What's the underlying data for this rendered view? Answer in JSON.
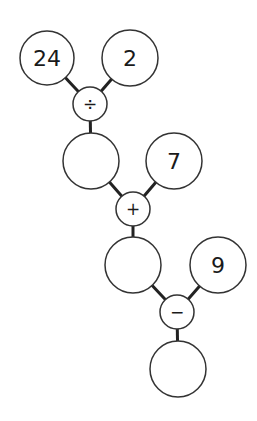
{
  "diagram": {
    "title": "",
    "nodes": {
      "n24": {
        "label": "24",
        "cx": 47,
        "cy": 58,
        "r": 27
      },
      "n2": {
        "label": "2",
        "cx": 130,
        "cy": 58,
        "r": 28
      },
      "op_div": {
        "label": "÷",
        "cx": 90,
        "cy": 104,
        "r": 17
      },
      "res1": {
        "label": "",
        "cx": 91,
        "cy": 161,
        "r": 28
      },
      "n7": {
        "label": "7",
        "cx": 174,
        "cy": 161,
        "r": 28
      },
      "op_add": {
        "label": "+",
        "cx": 133,
        "cy": 209,
        "r": 17
      },
      "res2": {
        "label": "",
        "cx": 133,
        "cy": 265,
        "r": 28
      },
      "n9": {
        "label": "9",
        "cx": 218,
        "cy": 265,
        "r": 28
      },
      "op_sub": {
        "label": "−",
        "cx": 177,
        "cy": 312,
        "r": 17
      },
      "res3": {
        "label": "",
        "cx": 178,
        "cy": 369,
        "r": 28
      }
    },
    "edges": [
      [
        "n24",
        "op_div"
      ],
      [
        "n2",
        "op_div"
      ],
      [
        "op_div",
        "res1"
      ],
      [
        "res1",
        "op_add"
      ],
      [
        "n7",
        "op_add"
      ],
      [
        "op_add",
        "res2"
      ],
      [
        "res2",
        "op_sub"
      ],
      [
        "n9",
        "op_sub"
      ],
      [
        "op_sub",
        "res3"
      ]
    ]
  }
}
